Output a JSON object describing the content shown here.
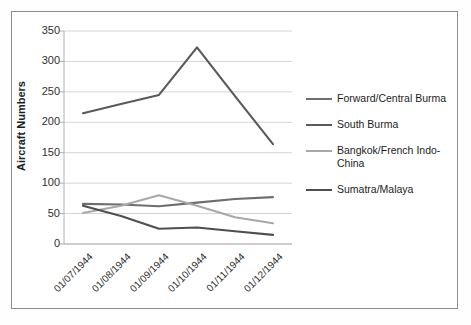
{
  "chart_data": {
    "type": "line",
    "title": "",
    "xlabel": "",
    "ylabel": "Aircraft Numbers",
    "categories": [
      "01/07/1944",
      "01/08/1944",
      "01/09/1944",
      "01/10/1944",
      "01/11/1944",
      "01/12/1944"
    ],
    "ylim": [
      0,
      350
    ],
    "yticks": [
      0,
      50,
      100,
      150,
      200,
      250,
      300,
      350
    ],
    "grid": "horizontal",
    "legend_position": "right",
    "series": [
      {
        "name": "Forward/Central Burma",
        "color": "#6e6e6e",
        "values": [
          66,
          65,
          62,
          68,
          74,
          77
        ]
      },
      {
        "name": "South Burma",
        "color": "#595959",
        "values": [
          215,
          230,
          245,
          323,
          243,
          164
        ]
      },
      {
        "name": "Bangkok/French Indo-China",
        "color": "#a8a8a8",
        "values": [
          51,
          63,
          80,
          63,
          44,
          34
        ]
      },
      {
        "name": "Sumatra/Malaya",
        "color": "#4f4f4f",
        "values": [
          63,
          46,
          25,
          27,
          21,
          15
        ]
      }
    ]
  },
  "axes": {
    "y_title": "Aircraft Numbers",
    "y_tick_labels": [
      "350",
      "300",
      "250",
      "200",
      "150",
      "100",
      "50",
      "0"
    ],
    "x_tick_labels": [
      "01/07/1944",
      "01/08/1944",
      "01/09/1944",
      "01/10/1944",
      "01/11/1944",
      "01/12/1944"
    ]
  },
  "legend": {
    "items": [
      {
        "label": "Forward/Central Burma",
        "color": "#6e6e6e"
      },
      {
        "label": "South Burma",
        "color": "#595959"
      },
      {
        "label": "Bangkok/French Indo-China",
        "color": "#a8a8a8"
      },
      {
        "label": "Sumatra/Malaya",
        "color": "#4f4f4f"
      }
    ]
  },
  "style": {
    "grid_color": "#d4d4d4",
    "axis_color": "#b0b0b0",
    "frame_color": "#8d8d8d",
    "background": "#ffffff"
  }
}
